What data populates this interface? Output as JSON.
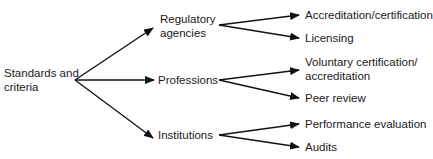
{
  "diagram": {
    "root": {
      "label": "Standards and\ncriteria"
    },
    "branches": [
      {
        "label": "Regulatory\nagencies",
        "children": [
          {
            "label": "Accreditation/certification"
          },
          {
            "label": "Licensing"
          }
        ]
      },
      {
        "label": "Professions",
        "children": [
          {
            "label": "Voluntary certification/\naccreditation"
          },
          {
            "label": "Peer review"
          }
        ]
      },
      {
        "label": "Institutions",
        "children": [
          {
            "label": "Performance evaluation"
          },
          {
            "label": "Audits"
          }
        ]
      }
    ],
    "line_color": "#111111"
  }
}
